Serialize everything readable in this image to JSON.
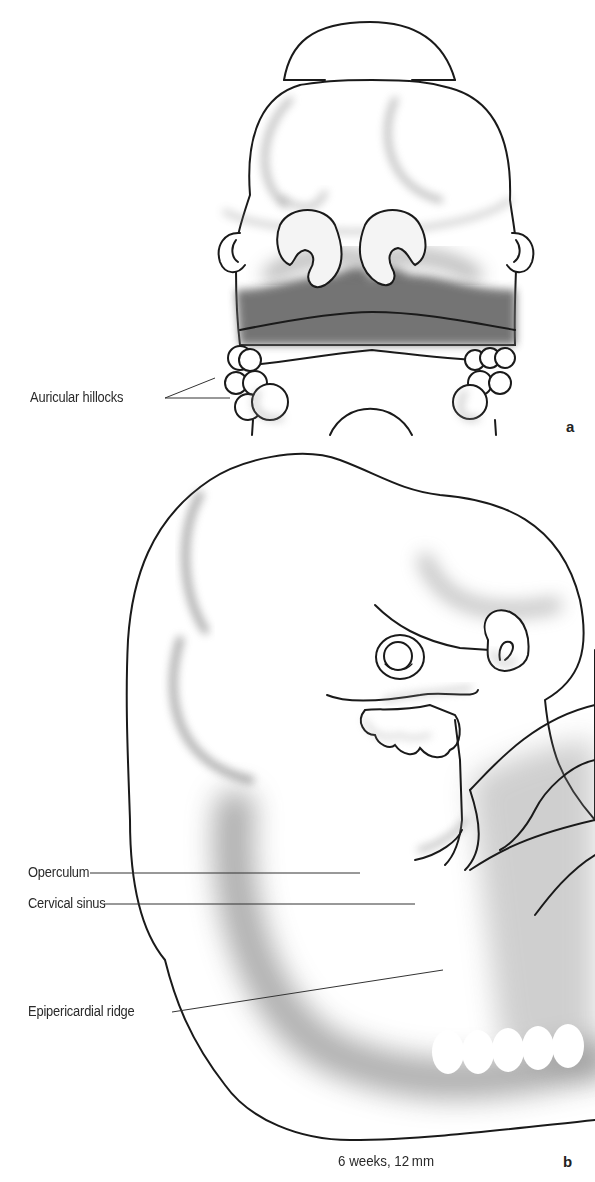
{
  "figure": {
    "panel_a": {
      "letter": "a",
      "labels": [
        {
          "text": "Auricular hillocks"
        }
      ]
    },
    "panel_b": {
      "letter": "b",
      "labels": [
        {
          "text": "Operculum"
        },
        {
          "text": "Cervical sinus"
        },
        {
          "text": "Epipericardial ridge"
        }
      ],
      "caption": "6 weeks, 12 mm"
    },
    "colors": {
      "outline": "#1a1a1a",
      "shading": "#6e6e6e",
      "dark_region": "#5f5f5f",
      "background": "#ffffff"
    }
  }
}
